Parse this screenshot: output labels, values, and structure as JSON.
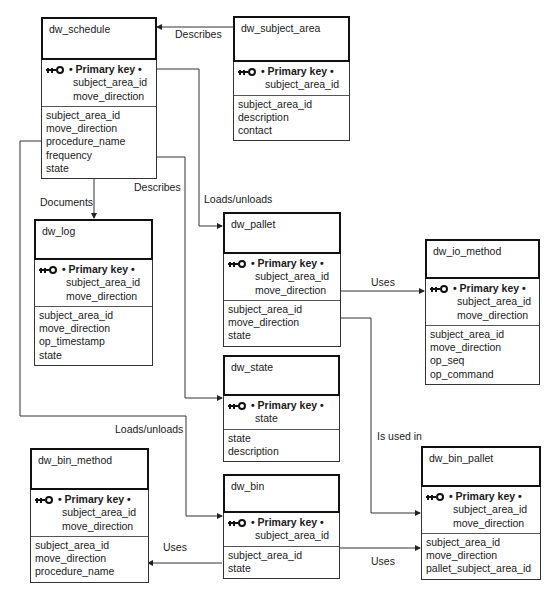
{
  "diagram": {
    "entities": {
      "dw_schedule": {
        "name": "dw_schedule",
        "pk_label": "• Primary key •",
        "pk": [
          "subject_area_id",
          "move_direction"
        ],
        "attrs": [
          "subject_area_id",
          "move_direction",
          "procedure_name",
          "frequency",
          "state"
        ]
      },
      "dw_subject_area": {
        "name": "dw_subject_area",
        "pk_label": "• Primary key •",
        "pk": [
          "subject_area_id"
        ],
        "attrs": [
          "subject_area_id",
          "description",
          "contact"
        ]
      },
      "dw_log": {
        "name": "dw_log",
        "pk_label": "• Primary key •",
        "pk": [
          "subject_area_id",
          "move_direction"
        ],
        "attrs": [
          "subject_area_id",
          "move_direction",
          "op_timestamp",
          "state"
        ]
      },
      "dw_pallet": {
        "name": "dw_pallet",
        "pk_label": "• Primary key •",
        "pk": [
          "subject_area_id",
          "move_direction"
        ],
        "attrs": [
          "subject_area_id",
          "move_direction",
          "state"
        ]
      },
      "dw_io_method": {
        "name": "dw_io_method",
        "pk_label": "• Primary key •",
        "pk": [
          "subject_area_id",
          "move_direction"
        ],
        "attrs": [
          "subject_area_id",
          "move_direction",
          "op_seq",
          "op_command"
        ]
      },
      "dw_state": {
        "name": "dw_state",
        "pk_label": "• Primary key •",
        "pk": [
          "state"
        ],
        "attrs": [
          "state",
          "description"
        ]
      },
      "dw_bin_method": {
        "name": "dw_bin_method",
        "pk_label": "• Primary key •",
        "pk": [
          "subject_area_id",
          "move_direction"
        ],
        "attrs": [
          "subject_area_id",
          "move_direction",
          "procedure_name"
        ]
      },
      "dw_bin": {
        "name": "dw_bin",
        "pk_label": "• Primary key •",
        "pk": [
          "subject_area_id"
        ],
        "attrs": [
          "subject_area_id",
          "state"
        ]
      },
      "dw_bin_pallet": {
        "name": "dw_bin_pallet",
        "pk_label": "• Primary key •",
        "pk": [
          "subject_area_id",
          "move_direction"
        ],
        "attrs": [
          "subject_area_id",
          "move_direction",
          "pallet_subject_area_id"
        ]
      }
    },
    "relationships": {
      "subject_area_schedule": "Describes",
      "schedule_log": "Documents",
      "schedule_state": "Describes",
      "schedule_pallet": "Loads/unloads",
      "pallet_io_method": "Uses",
      "pallet_bin_pallet": "Is used in",
      "schedule_bin": "Loads/unloads",
      "bin_bin_method": "Uses",
      "bin_bin_pallet": "Uses"
    }
  }
}
